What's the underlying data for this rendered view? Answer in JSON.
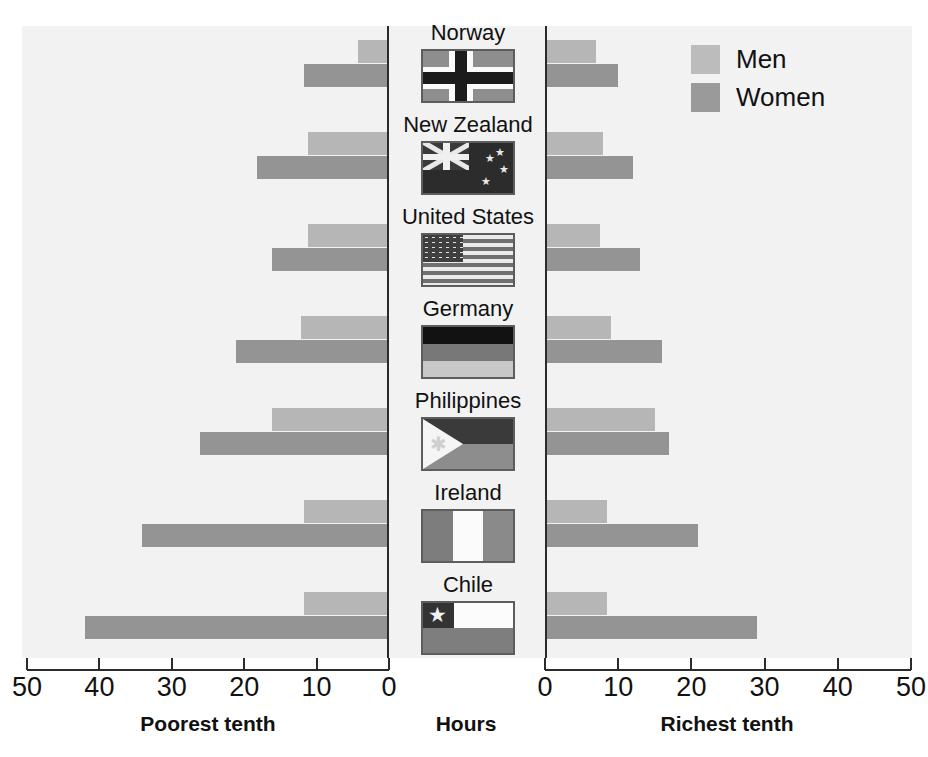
{
  "legend": {
    "items": [
      {
        "label": "Men",
        "color": "#bcbcbc",
        "key": "men"
      },
      {
        "label": "Women",
        "color": "#9a9a9a",
        "key": "women"
      }
    ]
  },
  "axes": {
    "left": {
      "title": "Poorest tenth",
      "ticks": [
        "50",
        "40",
        "30",
        "20",
        "10",
        "0"
      ],
      "min": 0,
      "max": 50,
      "reversed": true
    },
    "right": {
      "title": "Richest tenth",
      "ticks": [
        "0",
        "10",
        "20",
        "30",
        "40",
        "50"
      ],
      "min": 0,
      "max": 50,
      "reversed": false
    },
    "center_title": "Hours"
  },
  "countries": [
    {
      "name": "Norway",
      "flag": "norway"
    },
    {
      "name": "New Zealand",
      "flag": "new-zealand"
    },
    {
      "name": "United States",
      "flag": "united-states"
    },
    {
      "name": "Germany",
      "flag": "germany"
    },
    {
      "name": "Philippines",
      "flag": "philippines"
    },
    {
      "name": "Ireland",
      "flag": "ireland"
    },
    {
      "name": "Chile",
      "flag": "chile"
    }
  ],
  "chart_data": {
    "type": "bar",
    "title": "",
    "subtitle": "",
    "orientation": "horizontal",
    "layout": "back-to-back butterfly (two mirrored panels sharing category axis)",
    "categories": [
      "Norway",
      "New Zealand",
      "United States",
      "Germany",
      "Philippines",
      "Ireland",
      "Chile"
    ],
    "xlabel": "Hours",
    "ylabel": "",
    "grid": false,
    "legend_position": "top-right",
    "panels": [
      {
        "name": "Poorest tenth",
        "axis_label": "Poorest tenth",
        "xlim": [
          0,
          50
        ],
        "xticks": [
          50,
          40,
          30,
          20,
          10,
          0
        ],
        "direction": "right-to-left",
        "series": [
          {
            "name": "Men",
            "color": "#b6b6b6",
            "values": [
              4,
              11,
              11,
              12,
              16,
              11.5,
              11.5
            ]
          },
          {
            "name": "Women",
            "color": "#949494",
            "values": [
              11.5,
              18,
              16,
              21,
              26,
              34,
              42
            ]
          }
        ]
      },
      {
        "name": "Richest tenth",
        "axis_label": "Richest tenth",
        "xlim": [
          0,
          50
        ],
        "xticks": [
          0,
          10,
          20,
          30,
          40,
          50
        ],
        "direction": "left-to-right",
        "series": [
          {
            "name": "Men",
            "color": "#b6b6b6",
            "values": [
              7,
              8,
              7.5,
              9,
              15,
              8.5,
              8.5
            ]
          },
          {
            "name": "Women",
            "color": "#949494",
            "values": [
              10,
              12,
              13,
              16,
              17,
              21,
              29
            ]
          }
        ]
      }
    ]
  }
}
